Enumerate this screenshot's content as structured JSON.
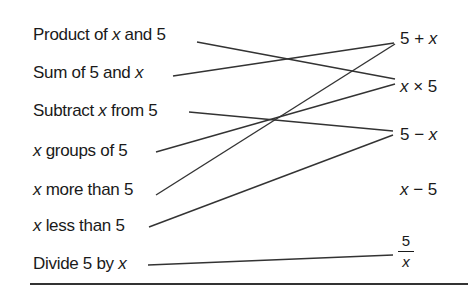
{
  "left_items": [
    {
      "id": "product",
      "pre": "Product of ",
      "var": "x",
      "post": " and 5",
      "x": 33,
      "y": 25,
      "line": [
        197,
        42,
        395,
        79
      ],
      "matches": "x × 5"
    },
    {
      "id": "sum",
      "pre": "Sum of 5 and ",
      "var": "x",
      "post": "",
      "x": 33,
      "y": 63,
      "line": [
        173,
        76,
        394,
        43
      ],
      "matches": "5 + x"
    },
    {
      "id": "subtract",
      "pre": "Subtract ",
      "var": "x",
      "post": " from 5",
      "x": 33,
      "y": 101,
      "line": [
        189,
        112,
        393,
        131
      ],
      "matches": "5 − x"
    },
    {
      "id": "groups",
      "pre": "",
      "var": "x",
      "post": " groups of 5",
      "x": 33,
      "y": 141,
      "line": [
        156,
        152,
        395,
        84
      ],
      "matches": "x × 5"
    },
    {
      "id": "more",
      "pre": "",
      "var": "x",
      "post": " more than 5",
      "x": 33,
      "y": 180,
      "line": [
        156,
        195,
        395,
        44
      ],
      "matches": "5 + x"
    },
    {
      "id": "less",
      "pre": "",
      "var": "x",
      "post": " less than 5",
      "x": 33,
      "y": 216,
      "line": [
        149,
        227,
        393,
        135
      ],
      "matches": "5 − x"
    },
    {
      "id": "divide",
      "pre": "Divide 5 by ",
      "var": "x",
      "post": "",
      "x": 33,
      "y": 254,
      "line": [
        148,
        265,
        393,
        255
      ],
      "matches": "5/x"
    }
  ],
  "right_items": [
    {
      "id": "sum-expr",
      "a": "5 + ",
      "b": "x",
      "order": "ab",
      "x": 400,
      "y": 29
    },
    {
      "id": "times-expr",
      "a": "x",
      "b": " × 5",
      "order": "var-first",
      "x": 400,
      "y": 77
    },
    {
      "id": "minus-expr",
      "a": "5 − ",
      "b": "x",
      "order": "ab",
      "x": 400,
      "y": 125
    },
    {
      "id": "xminus-expr",
      "a": "x",
      "b": " − 5",
      "order": "var-first",
      "x": 400,
      "y": 180
    }
  ],
  "fraction": {
    "numerator": "5",
    "denominator": "x"
  },
  "line_color": "#333333"
}
